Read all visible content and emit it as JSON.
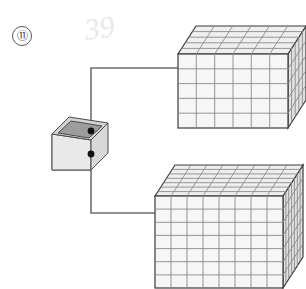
{
  "figure": {
    "label": "⑪",
    "label_plain": "11",
    "scribble": "39",
    "background_color": "#ffffff",
    "line_color": "#707070",
    "grid_color": "#8a8a8a",
    "edge_color": "#404040",
    "fill_face_color": "#f6f6f6",
    "fill_top_color": "#efefef",
    "fill_side_color": "#e2e2e2",
    "node_color": "#111111"
  },
  "container": {
    "name": "open-top-box",
    "body_fill": "#e7e7e7",
    "rim_fill": "#d2d2d2",
    "interior_fill": "#9d9d9d",
    "ports": [
      {
        "id": "top-port",
        "x": 91,
        "y": 131
      },
      {
        "id": "front-port",
        "x": 91,
        "y": 154
      }
    ]
  },
  "cubes": [
    {
      "id": "cube-top-right",
      "columns": 6,
      "rows": 5,
      "depth": 5,
      "front_left_x": 178,
      "front_top_y": 54,
      "front_width": 110,
      "front_height": 74,
      "depth_dx": 18,
      "depth_dy": -28
    },
    {
      "id": "cube-bottom-right",
      "columns": 8,
      "rows": 7,
      "depth": 7,
      "front_left_x": 155,
      "front_top_y": 196,
      "front_width": 128,
      "front_height": 92,
      "depth_dx": 20,
      "depth_dy": -31
    }
  ],
  "connectors": [
    {
      "id": "connector-top",
      "from_port": "top-port",
      "to_cube": "cube-top-right",
      "path": "M 91 131 L 91 68 L 178 68"
    },
    {
      "id": "connector-bottom",
      "from_port": "front-port",
      "to_cube": "cube-bottom-right",
      "path": "M 91 154 L 91 213 L 155 213"
    }
  ]
}
